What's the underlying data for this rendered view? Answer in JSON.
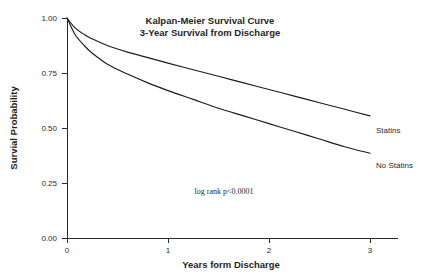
{
  "chart_data": {
    "type": "line",
    "title": "Kalpan-Meier Survival Curve",
    "subtitle": "3-Year Survival from Discharge",
    "xlabel": "Years form Discharge",
    "ylabel": "Survial Probability",
    "xlim": [
      0,
      3.1
    ],
    "ylim": [
      0.0,
      1.0
    ],
    "xticks": [
      0,
      1,
      2,
      3
    ],
    "xticklabels": [
      "0",
      "1",
      "2",
      "3"
    ],
    "yticks": [
      0.0,
      0.25,
      0.5,
      0.75,
      1.0
    ],
    "yticklabels": [
      "0.00",
      "0.25",
      "0.50",
      "0.75",
      "1.00"
    ],
    "grid": false,
    "legend_position": "inline-right-of-curve-ends",
    "annotation": "log rank p<0.0001",
    "line_color": "#1c1c1c",
    "series": [
      {
        "name": "Statins",
        "label": "Statins",
        "x": [
          0.0,
          0.08,
          0.17,
          0.25,
          0.4,
          0.6,
          0.8,
          1.0,
          1.25,
          1.5,
          1.75,
          2.0,
          2.25,
          2.5,
          2.75,
          3.0
        ],
        "values": [
          1.0,
          0.955,
          0.925,
          0.905,
          0.875,
          0.845,
          0.82,
          0.795,
          0.765,
          0.735,
          0.705,
          0.675,
          0.645,
          0.615,
          0.585,
          0.555
        ]
      },
      {
        "name": "No Statins",
        "label": "No Statins",
        "x": [
          0.0,
          0.08,
          0.17,
          0.25,
          0.4,
          0.6,
          0.8,
          1.0,
          1.25,
          1.5,
          1.75,
          2.0,
          2.25,
          2.5,
          2.75,
          3.0
        ],
        "values": [
          1.0,
          0.925,
          0.875,
          0.84,
          0.79,
          0.745,
          0.705,
          0.67,
          0.63,
          0.59,
          0.555,
          0.52,
          0.485,
          0.45,
          0.415,
          0.385
        ]
      }
    ]
  }
}
